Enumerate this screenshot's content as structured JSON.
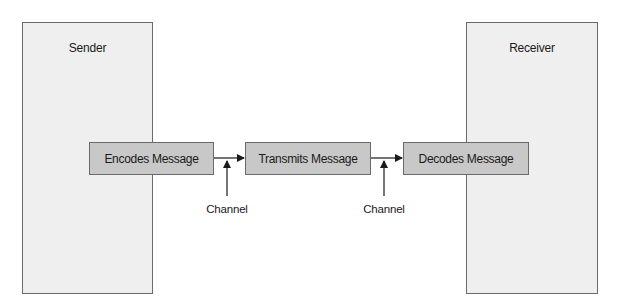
{
  "diagram": {
    "type": "communication-process",
    "parties": {
      "sender": {
        "label": "Sender"
      },
      "receiver": {
        "label": "Receiver"
      }
    },
    "steps": [
      {
        "label": "Encodes Message"
      },
      {
        "label": "Transmits Message"
      },
      {
        "label": "Decodes Message"
      }
    ],
    "channels": [
      {
        "label": "Channel",
        "between": [
          "Encodes Message",
          "Transmits Message"
        ]
      },
      {
        "label": "Channel",
        "between": [
          "Transmits Message",
          "Decodes Message"
        ]
      }
    ],
    "colors": {
      "party_fill": "#efefef",
      "step_fill": "#c8c8c8",
      "border": "#6a6a6a",
      "line": "#1a1a1a"
    }
  }
}
